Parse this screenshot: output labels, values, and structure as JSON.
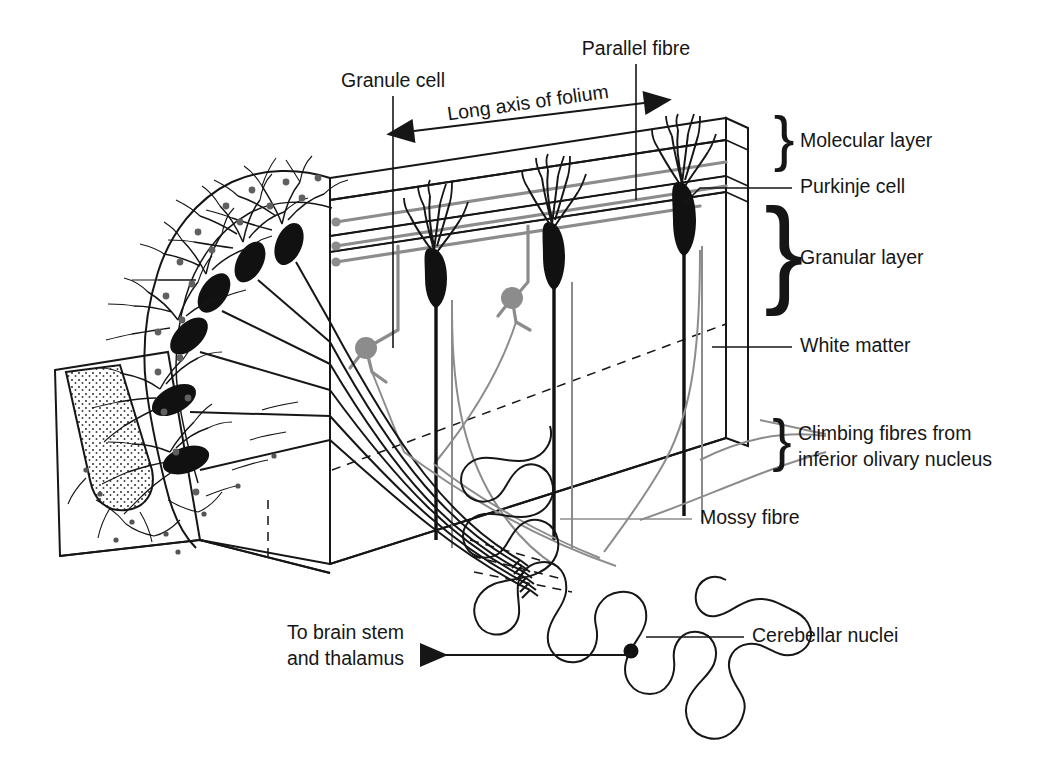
{
  "figure": {
    "ink_color": "#161616",
    "fiber_gray": "#8c8c8c",
    "soma_black": "#111111",
    "background": "#ffffff"
  },
  "labels": {
    "granule_cell": "Granule cell",
    "parallel_fibre": "Parallel fibre",
    "long_axis": "Long axis of folium",
    "molecular_layer": "Molecular layer",
    "purkinje_cell": "Purkinje cell",
    "granular_layer": "Granular layer",
    "white_matter": "White matter",
    "climbing_fibres_line1": "Climbing fibres from",
    "climbing_fibres_line2": "inferior olivary nucleus",
    "mossy_fibre": "Mossy fibre",
    "cerebellar_nuclei": "Cerebellar nuclei",
    "to_brain_stem_line1": "To brain stem",
    "to_brain_stem_line2": "and thalamus",
    "brace_glyph": "}"
  },
  "structures": {
    "folium_block": "cut block of cerebellar folium",
    "folium_section": "sagittal section of folium with Purkinje cells",
    "white_matter_core": "stippled white matter core",
    "cerebellar_nuclei_outline": "wavy deep nuclei outline",
    "efferent_dot": "efferent neuron cell body"
  },
  "counts": {
    "purkinje_cells_in_block": 3,
    "purkinje_cells_in_section": 6,
    "granule_cells": 2,
    "parallel_fibre_lines": 3,
    "climbing_fibres": 2,
    "mossy_fibres": 2,
    "efferent_axons": 6
  }
}
